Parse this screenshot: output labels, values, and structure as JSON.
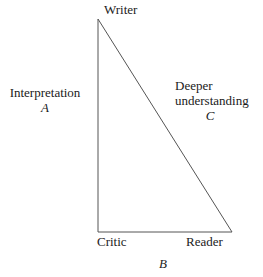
{
  "diagram": {
    "type": "right-triangle-relationship-diagram",
    "background_color": "#ffffff",
    "stroke_color": "#555555",
    "text_color": "#222222",
    "vertices": {
      "apex": {
        "label": "Writer",
        "x": 98,
        "y": 19
      },
      "bottom_left": {
        "label": "Critic",
        "x": 98,
        "y": 232
      },
      "bottom_right": {
        "label": "Reader",
        "x": 232,
        "y": 232
      }
    },
    "edges": {
      "left": {
        "name": "Interpretation",
        "variable": "A",
        "from": "Writer",
        "to": "Critic"
      },
      "bottom": {
        "name": "",
        "variable": "B",
        "from": "Critic",
        "to": "Reader"
      },
      "hypotenuse": {
        "name_line_1": "Deeper",
        "name_line_2": "understanding",
        "variable": "C",
        "from": "Writer",
        "to": "Reader"
      }
    }
  }
}
